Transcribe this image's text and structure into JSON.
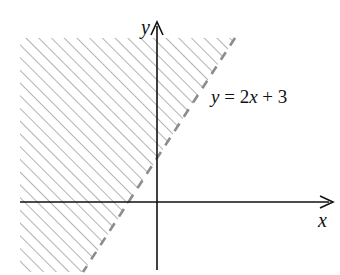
{
  "figure": {
    "type": "inequality-graph",
    "boundary_equation": "y = 2x + 3",
    "equation_parts": {
      "y": "y",
      "eq": " = 2",
      "x": "x",
      "rest": " + 3"
    },
    "boundary_style": "dashed",
    "shaded_side": "left/above boundary (y > 2x + 3)",
    "shading_style": "diagonal hatching",
    "x_axis_label": "x",
    "y_axis_label": "y",
    "colors": {
      "axis": "#111111",
      "hatch": "#8a8a8a",
      "boundary": "#8c8c8c",
      "background": "#ffffff"
    }
  }
}
